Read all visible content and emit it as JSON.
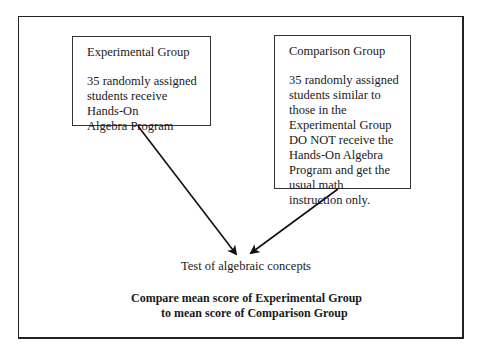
{
  "diagram": {
    "type": "experimental-design-flow",
    "experimental_group": {
      "title": "Experimental Group",
      "description": "35 randomly assigned\nstudents receive\nHands-On\nAlgebra Program"
    },
    "comparison_group": {
      "title": "Comparison Group",
      "description": "35 randomly assigned\nstudents similar to\nthose in the\nExperimental Group\nDO NOT receive the\nHands-On Algebra\nProgram and get the\nusual math\ninstruction only."
    },
    "test": {
      "label": "Test of algebraic concepts"
    },
    "comparison": {
      "line1": "Compare mean score of Experimental Group",
      "line2": "to mean score of Comparison Group"
    },
    "edges": [
      {
        "from": "Experimental Group",
        "to": "Test of algebraic concepts"
      },
      {
        "from": "Comparison Group",
        "to": "Test of algebraic concepts"
      }
    ]
  }
}
